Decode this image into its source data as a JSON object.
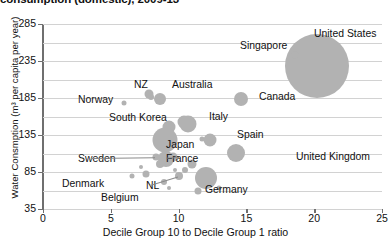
{
  "chart_data": {
    "type": "scatter",
    "title": "consumption (domestic), 2009-13",
    "xlabel": "Decile Group 10 to Decile Group 1 ratio",
    "ylabel": "Water Consmption (m³ per capita per year)",
    "xlim": [
      0,
      25
    ],
    "ylim": [
      35,
      285
    ],
    "xticks": [
      "0",
      "5",
      "10",
      "15",
      "20",
      "25"
    ],
    "yticks": [
      "285",
      "235",
      "185",
      "135",
      "85",
      "35"
    ],
    "gridlines_y": [
      285,
      260,
      235,
      210,
      185,
      160,
      135,
      110,
      85,
      60,
      35
    ],
    "grid": true,
    "legend": "none",
    "bubble_color": "#b2b2b2",
    "points": [
      {
        "name": "United States",
        "x": 20.2,
        "y": 228,
        "size": 64,
        "label_x": 314,
        "label_y": 28,
        "leader": false
      },
      {
        "name": "Singapore",
        "x": 18.6,
        "y": 243,
        "size": 7,
        "label_x": 240,
        "label_y": 40,
        "leader": false
      },
      {
        "name": "Canada",
        "x": 14.6,
        "y": 183,
        "size": 14,
        "label_x": 259,
        "label_y": 91,
        "leader": false
      },
      {
        "name": "Australia",
        "x": 8.6,
        "y": 183,
        "size": 12,
        "label_x": 172,
        "label_y": 79,
        "leader": false
      },
      {
        "name": "NZ",
        "x": 7.8,
        "y": 190,
        "size": 9,
        "label_x": 134,
        "label_y": 79,
        "leader": false
      },
      {
        "name": "Norway",
        "x": 6.0,
        "y": 178,
        "size": 5,
        "label_x": 78,
        "label_y": 94,
        "leader": false
      },
      {
        "name": "Italy",
        "x": 10.7,
        "y": 150,
        "size": 17,
        "label_x": 209,
        "label_y": 111,
        "leader": false
      },
      {
        "name": "South Korea",
        "x": 9.3,
        "y": 146,
        "size": 13,
        "label_x": 109,
        "label_y": 112,
        "leader": false
      },
      {
        "name": "Spain",
        "x": 12.3,
        "y": 128,
        "size": 13,
        "label_x": 237,
        "label_y": 129,
        "leader": false
      },
      {
        "name": "United Kingdom",
        "x": 14.2,
        "y": 111,
        "size": 18,
        "label_x": 296,
        "label_y": 151,
        "leader": false
      },
      {
        "name": "Japan",
        "x": 9.0,
        "y": 128,
        "size": 25,
        "label_x": 166,
        "label_y": 139,
        "leader": false
      },
      {
        "name": "France",
        "x": 9.1,
        "y": 103,
        "size": 16,
        "label_x": 166,
        "label_y": 153,
        "leader": true
      },
      {
        "name": "Sweden",
        "x": 8.3,
        "y": 105,
        "size": 7,
        "label_x": 78,
        "label_y": 153,
        "leader": true
      },
      {
        "name": "Germany",
        "x": 12.0,
        "y": 77,
        "size": 22,
        "label_x": 205,
        "label_y": 184,
        "leader": false
      },
      {
        "name": "NL",
        "x": 10.0,
        "y": 79,
        "size": 8,
        "label_x": 146,
        "label_y": 180,
        "leader": true
      },
      {
        "name": "Denmark",
        "x": 7.6,
        "y": 82,
        "size": 7,
        "label_x": 62,
        "label_y": 178,
        "leader": false
      },
      {
        "name": "Belgium",
        "x": 8.9,
        "y": 72,
        "size": 6,
        "label_x": 101,
        "label_y": 192,
        "leader": false
      }
    ],
    "extra_bubbles": [
      {
        "x": 8.0,
        "y": 186,
        "size": 6
      },
      {
        "x": 10.4,
        "y": 152,
        "size": 13
      },
      {
        "x": 11.7,
        "y": 130,
        "size": 5
      },
      {
        "x": 9.6,
        "y": 105,
        "size": 9
      },
      {
        "x": 8.6,
        "y": 96,
        "size": 8
      },
      {
        "x": 10.5,
        "y": 88,
        "size": 6
      },
      {
        "x": 11.0,
        "y": 96,
        "size": 9
      },
      {
        "x": 7.2,
        "y": 92,
        "size": 4
      },
      {
        "x": 6.6,
        "y": 80,
        "size": 5
      },
      {
        "x": 9.7,
        "y": 88,
        "size": 4
      },
      {
        "x": 11.4,
        "y": 59,
        "size": 7
      },
      {
        "x": 13.0,
        "y": 63,
        "size": 5
      },
      {
        "x": 9.3,
        "y": 64,
        "size": 4
      }
    ]
  }
}
